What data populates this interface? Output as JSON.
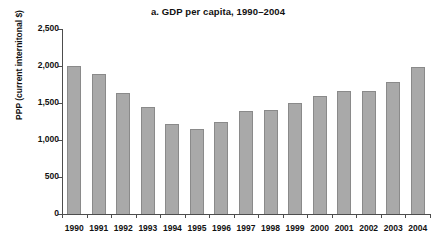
{
  "chart_data": {
    "type": "bar",
    "title": "a. GDP per capita, 1990–2004",
    "xlabel": "",
    "ylabel": "PPP (current internitonal $)",
    "categories": [
      "1990",
      "1991",
      "1992",
      "1993",
      "1994",
      "1995",
      "1996",
      "1997",
      "1998",
      "1999",
      "2000",
      "2001",
      "2002",
      "2003",
      "2004"
    ],
    "values": [
      2000,
      1890,
      1640,
      1440,
      1215,
      1155,
      1240,
      1390,
      1410,
      1495,
      1590,
      1665,
      1660,
      1790,
      1985
    ],
    "ylim": [
      0,
      2500
    ],
    "ytick_values": [
      0,
      500,
      1000,
      1500,
      2000,
      2500
    ],
    "ytick_labels": [
      "0",
      "500",
      "1,000",
      "1,500",
      "2,000",
      "2,500"
    ],
    "grid": false,
    "legend": "none",
    "bar_color": "#a9a9a9",
    "bar_edge_color": "#8a8a8a",
    "axis_color": "#4d4d4d"
  }
}
